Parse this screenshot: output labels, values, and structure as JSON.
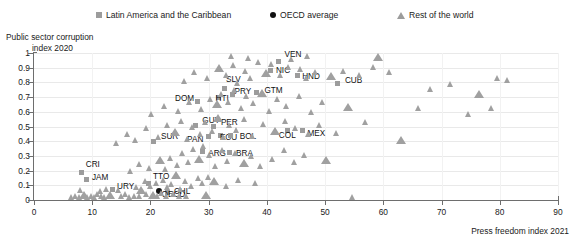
{
  "legend": {
    "items": [
      {
        "label": "Latin America and the Caribbean",
        "marker": "square-marker-icon",
        "color": "#9c9c9c"
      },
      {
        "label": "OECD average",
        "marker": "dot-marker-icon",
        "color": "#111111"
      },
      {
        "label": "Rest of the world",
        "marker": "triangle-marker-icon",
        "color": "#9c9c9c"
      }
    ]
  },
  "axes": {
    "ytitle_line1": "Public sector corruption",
    "ytitle_line2": "index 2020",
    "xtitle": "Press freedom index 2021",
    "yticks": [
      "1",
      "0.9",
      "0.8",
      "0.7",
      "0.6",
      "0.5",
      "0.4",
      "0.3",
      "0.2",
      "0.1",
      "0"
    ],
    "xticks": [
      "0",
      "10",
      "20",
      "30",
      "40",
      "50",
      "60",
      "70",
      "80",
      "90"
    ]
  },
  "chart_data": {
    "type": "scatter",
    "title": "",
    "xlabel": "Press freedom index 2021",
    "ylabel": "Public sector corruption index 2020",
    "xlim": [
      0,
      90
    ],
    "ylim": [
      0,
      1
    ],
    "grid": true,
    "legend_position": "top",
    "series": [
      {
        "name": "Latin America and the Caribbean",
        "marker": "square",
        "color": "#9c9c9c",
        "points": [
          {
            "label": "CRI",
            "x": 8.2,
            "y": 0.19
          },
          {
            "label": "JAM",
            "x": 9.1,
            "y": 0.14
          },
          {
            "label": "URY",
            "x": 13.4,
            "y": 0.07
          },
          {
            "label": "TTO",
            "x": 19.6,
            "y": 0.11
          },
          {
            "label": "CHL",
            "x": 23.0,
            "y": 0.05
          },
          {
            "label": "SUR",
            "x": 20.6,
            "y": 0.4
          },
          {
            "label": "GUY",
            "x": 27.7,
            "y": 0.51
          },
          {
            "label": "PER",
            "x": 30.9,
            "y": 0.5
          },
          {
            "label": "PAN",
            "x": 29.9,
            "y": 0.43
          },
          {
            "label": "ECU",
            "x": 32.1,
            "y": 0.44
          },
          {
            "label": "BOL",
            "x": 33.8,
            "y": 0.44
          },
          {
            "label": "ARG",
            "x": 28.9,
            "y": 0.33
          },
          {
            "label": "BRA",
            "x": 33.5,
            "y": 0.32
          },
          {
            "label": "DOM",
            "x": 28.0,
            "y": 0.67
          },
          {
            "label": "SLV",
            "x": 32.8,
            "y": 0.76
          },
          {
            "label": "HTI",
            "x": 31.7,
            "y": 0.7
          },
          {
            "label": "PRY",
            "x": 34.1,
            "y": 0.72
          },
          {
            "label": "GTM",
            "x": 38.2,
            "y": 0.73
          },
          {
            "label": "NIC",
            "x": 40.7,
            "y": 0.88
          },
          {
            "label": "VEN",
            "x": 42.0,
            "y": 0.94
          },
          {
            "label": "HND",
            "x": 45.2,
            "y": 0.85
          },
          {
            "label": "COL",
            "x": 43.6,
            "y": 0.47
          },
          {
            "label": "MEX",
            "x": 46.1,
            "y": 0.47
          },
          {
            "label": "CUB",
            "x": 52.2,
            "y": 0.79
          }
        ]
      },
      {
        "name": "OECD average",
        "marker": "dot",
        "color": "#111111",
        "points": [
          {
            "label": "OECD",
            "x": 21.4,
            "y": 0.06
          }
        ]
      },
      {
        "name": "Rest of the world",
        "marker": "triangle",
        "color": "#a0a0a0",
        "points": [
          {
            "x": 6.4,
            "y": 0.01
          },
          {
            "x": 7.2,
            "y": 0.02
          },
          {
            "x": 7.8,
            "y": 0.01
          },
          {
            "x": 8.6,
            "y": 0.02
          },
          {
            "x": 9.2,
            "y": 0.01
          },
          {
            "x": 9.9,
            "y": 0.02
          },
          {
            "x": 10.4,
            "y": 0.01
          },
          {
            "x": 11.0,
            "y": 0.03
          },
          {
            "x": 11.6,
            "y": 0.02
          },
          {
            "x": 12.2,
            "y": 0.01
          },
          {
            "x": 13.0,
            "y": 0.02
          },
          {
            "x": 15.1,
            "y": 0.02
          },
          {
            "x": 15.8,
            "y": 0.03
          },
          {
            "x": 16.4,
            "y": 0.01
          },
          {
            "x": 17.2,
            "y": 0.02
          },
          {
            "x": 18.1,
            "y": 0.02
          },
          {
            "x": 19.3,
            "y": 0.03
          },
          {
            "x": 20.4,
            "y": 0.02
          },
          {
            "x": 21.2,
            "y": 0.02
          },
          {
            "x": 22.0,
            "y": 0.04
          },
          {
            "x": 22.8,
            "y": 0.02
          },
          {
            "x": 24.0,
            "y": 0.03
          },
          {
            "x": 25.0,
            "y": 0.02
          },
          {
            "x": 26.2,
            "y": 0.02
          },
          {
            "x": 29.6,
            "y": 0.02
          },
          {
            "x": 54.8,
            "y": 0.01
          },
          {
            "x": 8.0,
            "y": 0.06
          },
          {
            "x": 11.4,
            "y": 0.05
          },
          {
            "x": 12.4,
            "y": 0.07
          },
          {
            "x": 14.6,
            "y": 0.06
          },
          {
            "x": 17.6,
            "y": 0.08
          },
          {
            "x": 18.4,
            "y": 0.06
          },
          {
            "x": 19.1,
            "y": 0.12
          },
          {
            "x": 20.0,
            "y": 0.09
          },
          {
            "x": 21.0,
            "y": 0.11
          },
          {
            "x": 22.2,
            "y": 0.13
          },
          {
            "x": 22.9,
            "y": 0.08
          },
          {
            "x": 23.6,
            "y": 0.1
          },
          {
            "x": 24.4,
            "y": 0.16
          },
          {
            "x": 25.2,
            "y": 0.07
          },
          {
            "x": 26.0,
            "y": 0.12
          },
          {
            "x": 27.0,
            "y": 0.09
          },
          {
            "x": 28.2,
            "y": 0.14
          },
          {
            "x": 29.0,
            "y": 0.11
          },
          {
            "x": 30.0,
            "y": 0.15
          },
          {
            "x": 31.0,
            "y": 0.12
          },
          {
            "x": 33.0,
            "y": 0.09
          },
          {
            "x": 35.2,
            "y": 0.13
          },
          {
            "x": 38.0,
            "y": 0.11
          },
          {
            "x": 16.6,
            "y": 0.19
          },
          {
            "x": 18.2,
            "y": 0.24
          },
          {
            "x": 19.8,
            "y": 0.21
          },
          {
            "x": 21.6,
            "y": 0.26
          },
          {
            "x": 22.6,
            "y": 0.2
          },
          {
            "x": 23.4,
            "y": 0.28
          },
          {
            "x": 24.6,
            "y": 0.23
          },
          {
            "x": 25.6,
            "y": 0.31
          },
          {
            "x": 26.6,
            "y": 0.25
          },
          {
            "x": 27.4,
            "y": 0.34
          },
          {
            "x": 28.4,
            "y": 0.27
          },
          {
            "x": 29.2,
            "y": 0.36
          },
          {
            "x": 30.2,
            "y": 0.3
          },
          {
            "x": 31.2,
            "y": 0.22
          },
          {
            "x": 32.4,
            "y": 0.33
          },
          {
            "x": 33.2,
            "y": 0.26
          },
          {
            "x": 34.6,
            "y": 0.31
          },
          {
            "x": 36.0,
            "y": 0.24
          },
          {
            "x": 37.4,
            "y": 0.29
          },
          {
            "x": 39.0,
            "y": 0.22
          },
          {
            "x": 41.0,
            "y": 0.27
          },
          {
            "x": 43.0,
            "y": 0.33
          },
          {
            "x": 44.8,
            "y": 0.25
          },
          {
            "x": 46.4,
            "y": 0.3
          },
          {
            "x": 50.2,
            "y": 0.26
          },
          {
            "x": 14.2,
            "y": 0.38
          },
          {
            "x": 16.0,
            "y": 0.44
          },
          {
            "x": 17.4,
            "y": 0.4
          },
          {
            "x": 19.4,
            "y": 0.48
          },
          {
            "x": 21.4,
            "y": 0.42
          },
          {
            "x": 23.0,
            "y": 0.5
          },
          {
            "x": 24.2,
            "y": 0.45
          },
          {
            "x": 25.4,
            "y": 0.53
          },
          {
            "x": 26.4,
            "y": 0.41
          },
          {
            "x": 27.2,
            "y": 0.49
          },
          {
            "x": 28.6,
            "y": 0.44
          },
          {
            "x": 29.4,
            "y": 0.52
          },
          {
            "x": 30.6,
            "y": 0.46
          },
          {
            "x": 31.6,
            "y": 0.55
          },
          {
            "x": 32.6,
            "y": 0.42
          },
          {
            "x": 33.6,
            "y": 0.5
          },
          {
            "x": 34.8,
            "y": 0.47
          },
          {
            "x": 36.2,
            "y": 0.54
          },
          {
            "x": 37.6,
            "y": 0.43
          },
          {
            "x": 39.4,
            "y": 0.51
          },
          {
            "x": 41.4,
            "y": 0.46
          },
          {
            "x": 43.2,
            "y": 0.53
          },
          {
            "x": 45.0,
            "y": 0.48
          },
          {
            "x": 47.2,
            "y": 0.44
          },
          {
            "x": 49.0,
            "y": 0.5
          },
          {
            "x": 52.0,
            "y": 0.45
          },
          {
            "x": 57.0,
            "y": 0.52
          },
          {
            "x": 63.0,
            "y": 0.4
          },
          {
            "x": 20.2,
            "y": 0.58
          },
          {
            "x": 22.4,
            "y": 0.63
          },
          {
            "x": 24.8,
            "y": 0.6
          },
          {
            "x": 26.8,
            "y": 0.66
          },
          {
            "x": 28.8,
            "y": 0.61
          },
          {
            "x": 30.4,
            "y": 0.68
          },
          {
            "x": 31.4,
            "y": 0.64
          },
          {
            "x": 32.2,
            "y": 0.71
          },
          {
            "x": 33.4,
            "y": 0.66
          },
          {
            "x": 34.4,
            "y": 0.74
          },
          {
            "x": 35.6,
            "y": 0.62
          },
          {
            "x": 36.6,
            "y": 0.7
          },
          {
            "x": 37.8,
            "y": 0.65
          },
          {
            "x": 39.2,
            "y": 0.72
          },
          {
            "x": 40.4,
            "y": 0.6
          },
          {
            "x": 41.8,
            "y": 0.68
          },
          {
            "x": 43.4,
            "y": 0.63
          },
          {
            "x": 45.6,
            "y": 0.7
          },
          {
            "x": 47.6,
            "y": 0.59
          },
          {
            "x": 49.6,
            "y": 0.66
          },
          {
            "x": 54.0,
            "y": 0.62
          },
          {
            "x": 66.0,
            "y": 0.62
          },
          {
            "x": 74.6,
            "y": 0.58
          },
          {
            "x": 78.6,
            "y": 0.62
          },
          {
            "x": 25.8,
            "y": 0.8
          },
          {
            "x": 27.6,
            "y": 0.86
          },
          {
            "x": 29.8,
            "y": 0.82
          },
          {
            "x": 31.8,
            "y": 0.89
          },
          {
            "x": 33.0,
            "y": 0.84
          },
          {
            "x": 34.2,
            "y": 0.91
          },
          {
            "x": 35.0,
            "y": 0.79
          },
          {
            "x": 36.4,
            "y": 0.87
          },
          {
            "x": 37.2,
            "y": 0.82
          },
          {
            "x": 38.6,
            "y": 0.93
          },
          {
            "x": 39.8,
            "y": 0.85
          },
          {
            "x": 40.8,
            "y": 0.92
          },
          {
            "x": 42.4,
            "y": 0.84
          },
          {
            "x": 43.8,
            "y": 0.9
          },
          {
            "x": 45.8,
            "y": 0.88
          },
          {
            "x": 46.8,
            "y": 0.82
          },
          {
            "x": 48.4,
            "y": 0.86
          },
          {
            "x": 51.0,
            "y": 0.83
          },
          {
            "x": 53.2,
            "y": 0.87
          },
          {
            "x": 56.0,
            "y": 0.84
          },
          {
            "x": 58.4,
            "y": 0.9
          },
          {
            "x": 61.0,
            "y": 0.86
          },
          {
            "x": 68.2,
            "y": 0.75
          },
          {
            "x": 71.6,
            "y": 0.78
          },
          {
            "x": 76.4,
            "y": 0.71
          },
          {
            "x": 79.6,
            "y": 0.82
          },
          {
            "x": 81.4,
            "y": 0.81
          },
          {
            "x": 34.0,
            "y": 0.97
          },
          {
            "x": 36.8,
            "y": 0.96
          },
          {
            "x": 44.2,
            "y": 0.95
          },
          {
            "x": 47.0,
            "y": 0.97
          },
          {
            "x": 59.0,
            "y": 0.96
          }
        ]
      }
    ]
  }
}
